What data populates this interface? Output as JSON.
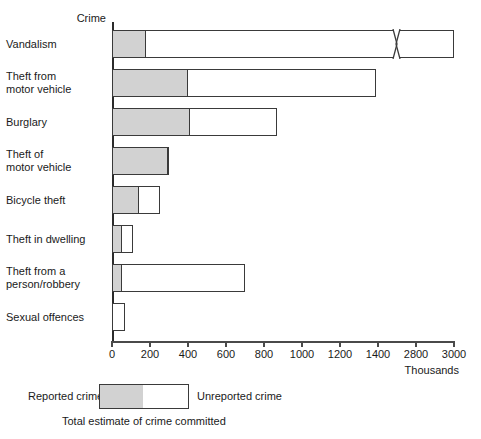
{
  "chart_data": {
    "type": "bar",
    "orientation": "horizontal",
    "stacked": true,
    "title": "",
    "xlabel": "Thousands",
    "ylabel": "Crime",
    "categories": [
      "Vandalism",
      "Theft from\nmotor vehicle",
      "Burglary",
      "Theft of\nmotor vehicle",
      "Bicycle theft",
      "Theft in dwelling",
      "Theft from a\nperson/robbery",
      "Sexual offences"
    ],
    "series": [
      {
        "name": "Reported crime",
        "color": "#d2d2d2",
        "values": [
          170,
          390,
          400,
          285,
          130,
          42,
          40,
          0
        ]
      },
      {
        "name": "Unreported crime",
        "color": "#ffffff",
        "values": [
          2830,
          1000,
          470,
          15,
          120,
          70,
          660,
          70
        ]
      }
    ],
    "totals": [
      3000,
      1390,
      870,
      300,
      250,
      112,
      700,
      70
    ],
    "xticks": [
      0,
      200,
      400,
      600,
      800,
      1000,
      1200,
      1400,
      2800,
      3000
    ],
    "xtick_labels": [
      "0",
      "200",
      "400",
      "600",
      "800",
      "1000",
      "1200",
      "1400",
      "2800",
      "3000"
    ],
    "axis_break": {
      "present": true,
      "between": [
        1400,
        2800
      ],
      "marker": "zigzag"
    },
    "grid": false,
    "legend_position": "bottom"
  },
  "axis": {
    "y_caption": "Crime",
    "x_units": "Thousands"
  },
  "legend": {
    "reported_label": "Reported crime",
    "unreported_label": "Unreported crime",
    "total_label": "Total estimate of crime committed"
  }
}
